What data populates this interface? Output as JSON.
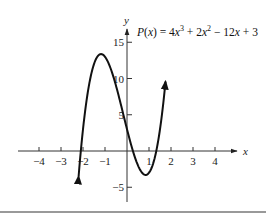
{
  "chart_data": {
    "type": "line",
    "equation": {
      "lhs": "P(x)",
      "terms": [
        "4x",
        "3",
        " + 2x",
        "2",
        " − 12x + 3"
      ],
      "coefficients": [
        4,
        2,
        -12,
        3
      ]
    },
    "xlabel": "x",
    "ylabel": "y",
    "xlim": [
      -5,
      5
    ],
    "ylim": [
      -7,
      17
    ],
    "x_ticks": [
      -4,
      -3,
      -2,
      -1,
      1,
      2,
      3,
      4
    ],
    "x_tick_labels": [
      "−4",
      "−3",
      "−2",
      "−1",
      "1",
      "2",
      "3",
      "4"
    ],
    "y_ticks": [
      15,
      10,
      5,
      -5
    ],
    "y_tick_labels": [
      "15",
      "10",
      "5",
      "−5"
    ],
    "grid": false,
    "series": [
      {
        "name": "P(x)",
        "x_range": [
          -2.2,
          1.75
        ],
        "x": [
          -2.2,
          -2.0,
          -1.5,
          -1.18,
          -1.0,
          -0.5,
          0,
          0.5,
          0.85,
          1.0,
          1.5,
          1.75
        ],
        "y": [
          -4.4,
          3.0,
          13.5,
          13.4,
          13.0,
          9.0,
          3.0,
          -2.0,
          -3.4,
          -3.0,
          4.5,
          15.1
        ]
      }
    ],
    "annotations": [
      "P(x) = 4x³ + 2x² − 12x + 3"
    ]
  }
}
